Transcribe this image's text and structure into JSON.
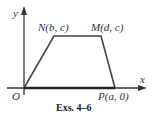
{
  "figure": {
    "caption": "Exs. 4–6",
    "axes": {
      "x_label": "x",
      "y_label": "y"
    },
    "points": {
      "O": {
        "label": "O"
      },
      "N": {
        "label": "N(b, c)"
      },
      "M": {
        "label": "M(d, c)"
      },
      "P": {
        "label": "P(a, 0)"
      }
    },
    "shape": "trapezoid ONMP",
    "colors": {
      "stroke": "#333333",
      "text": "#333333"
    }
  }
}
